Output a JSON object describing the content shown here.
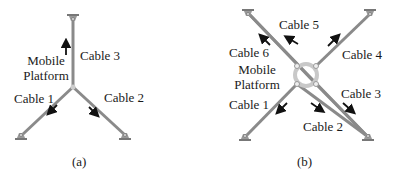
{
  "panel_a": {
    "caption": "(a)",
    "platform_label_line1": "Mobile",
    "platform_label_line2": "Platform",
    "cables": [
      {
        "id": 1,
        "label": "Cable 1"
      },
      {
        "id": 2,
        "label": "Cable 2"
      },
      {
        "id": 3,
        "label": "Cable 3"
      }
    ]
  },
  "panel_b": {
    "caption": "(b)",
    "platform_label_line1": "Mobile",
    "platform_label_line2": "Platform",
    "cables": [
      {
        "id": 1,
        "label": "Cable 1"
      },
      {
        "id": 2,
        "label": "Cable 2"
      },
      {
        "id": 3,
        "label": "Cable 3"
      },
      {
        "id": 4,
        "label": "Cable 4"
      },
      {
        "id": 5,
        "label": "Cable 5"
      },
      {
        "id": 6,
        "label": "Cable 6"
      }
    ]
  },
  "colors": {
    "cable": "#8a8a8a",
    "ring": "#c8c8c8",
    "arrow": "#111111",
    "text": "#1a1a1a"
  }
}
